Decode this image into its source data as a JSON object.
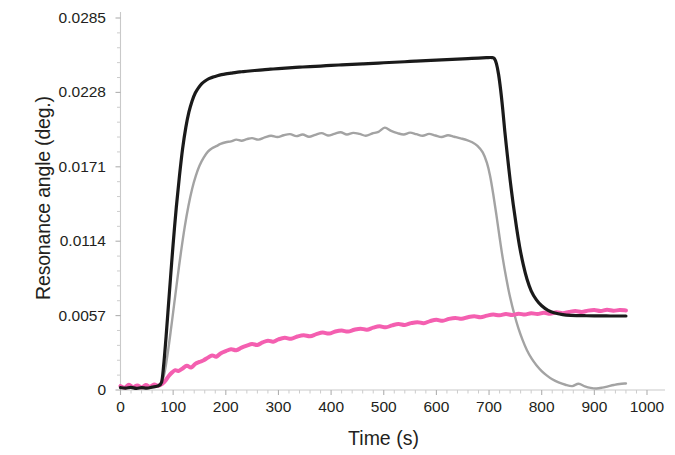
{
  "chart_data": {
    "type": "line",
    "title": "",
    "xlabel": "Time (s)",
    "ylabel": "Resonance angle (deg.)",
    "xlim": [
      0,
      1000
    ],
    "ylim": [
      0,
      0.0285
    ],
    "xticks": [
      0,
      100,
      200,
      300,
      400,
      500,
      600,
      700,
      800,
      900,
      1000
    ],
    "xtick_labels": [
      "0",
      "100",
      "200",
      "300",
      "400",
      "500",
      "600",
      "700",
      "800",
      "900",
      "1000"
    ],
    "yticks": [
      0,
      0.0057,
      0.0114,
      0.0171,
      0.0228,
      0.0285
    ],
    "ytick_labels": [
      "0",
      "0.0057",
      "0.0114",
      "0.0171",
      "0.0228",
      "0.0285"
    ],
    "grid": false,
    "legend": "none",
    "minor_ticks": true,
    "series": [
      {
        "name": "black-curve",
        "color": "#1a1a1a",
        "line_width": 3.2,
        "x": [
          0,
          10,
          20,
          30,
          40,
          50,
          60,
          70,
          78,
          82,
          86,
          90,
          95,
          100,
          106,
          112,
          118,
          124,
          130,
          136,
          142,
          148,
          154,
          160,
          168,
          176,
          184,
          192,
          200,
          210,
          220,
          230,
          240,
          255,
          270,
          285,
          300,
          320,
          340,
          360,
          380,
          400,
          420,
          440,
          460,
          480,
          500,
          520,
          540,
          560,
          580,
          600,
          620,
          640,
          660,
          680,
          695,
          705,
          710,
          714,
          718,
          722,
          726,
          730,
          735,
          740,
          746,
          752,
          758,
          765,
          772,
          780,
          790,
          800,
          812,
          825,
          840,
          855,
          870,
          885,
          900,
          915,
          930,
          945,
          960
        ],
        "y": [
          0.00018,
          0.00015,
          0.0002,
          0.00012,
          0.00018,
          0.00015,
          0.00022,
          0.0003,
          0.0006,
          0.0019,
          0.0038,
          0.0059,
          0.0086,
          0.0112,
          0.014,
          0.0164,
          0.0185,
          0.0201,
          0.0213,
          0.02215,
          0.02275,
          0.02315,
          0.02345,
          0.02365,
          0.02385,
          0.02398,
          0.02408,
          0.02416,
          0.02422,
          0.02428,
          0.02434,
          0.02438,
          0.02442,
          0.02448,
          0.02453,
          0.02458,
          0.02462,
          0.02468,
          0.02473,
          0.02478,
          0.02482,
          0.02487,
          0.02491,
          0.02495,
          0.02499,
          0.02503,
          0.02507,
          0.02511,
          0.02515,
          0.02519,
          0.02523,
          0.02527,
          0.02531,
          0.02535,
          0.02539,
          0.02543,
          0.02546,
          0.02547,
          0.0254,
          0.025,
          0.0242,
          0.023,
          0.0215,
          0.0198,
          0.0179,
          0.0161,
          0.0142,
          0.0125,
          0.011,
          0.0096,
          0.0085,
          0.0076,
          0.0069,
          0.00645,
          0.0061,
          0.0059,
          0.00578,
          0.00572,
          0.0057,
          0.00569,
          0.00568,
          0.00568,
          0.00567,
          0.00567,
          0.00567
        ]
      },
      {
        "name": "grey-curve",
        "color": "#a3a3a3",
        "line_width": 2.4,
        "x": [
          0,
          10,
          20,
          30,
          40,
          50,
          60,
          70,
          78,
          84,
          90,
          96,
          102,
          108,
          115,
          122,
          129,
          136,
          143,
          150,
          158,
          166,
          174,
          182,
          190,
          200,
          210,
          220,
          230,
          240,
          250,
          262,
          274,
          286,
          298,
          310,
          322,
          334,
          346,
          358,
          370,
          382,
          394,
          406,
          418,
          430,
          442,
          454,
          466,
          478,
          490,
          502,
          514,
          526,
          538,
          550,
          562,
          574,
          586,
          598,
          610,
          622,
          634,
          646,
          658,
          668,
          678,
          688,
          696,
          702,
          708,
          714,
          720,
          726,
          733,
          740,
          748,
          756,
          764,
          772,
          781,
          790,
          800,
          810,
          820,
          832,
          845,
          858,
          870,
          882,
          893,
          904,
          915,
          926,
          937,
          948,
          960
        ],
        "y": [
          0.00022,
          0.00016,
          0.00024,
          0.00014,
          0.0002,
          0.00018,
          0.00026,
          0.00034,
          0.00055,
          0.0014,
          0.0029,
          0.0047,
          0.0066,
          0.0085,
          0.0106,
          0.0125,
          0.0141,
          0.0154,
          0.0164,
          0.01718,
          0.0178,
          0.01826,
          0.01852,
          0.01868,
          0.01885,
          0.01898,
          0.01905,
          0.01918,
          0.0191,
          0.01922,
          0.0193,
          0.01918,
          0.01935,
          0.01948,
          0.01938,
          0.01952,
          0.0196,
          0.01945,
          0.01958,
          0.0194,
          0.01955,
          0.01968,
          0.0195,
          0.01962,
          0.01975,
          0.01958,
          0.0197,
          0.01962,
          0.01948,
          0.01965,
          0.01978,
          0.0201,
          0.01985,
          0.01968,
          0.01958,
          0.01972,
          0.0196,
          0.01948,
          0.01962,
          0.0195,
          0.01938,
          0.01952,
          0.0194,
          0.01928,
          0.01915,
          0.01898,
          0.0187,
          0.0182,
          0.0174,
          0.0164,
          0.015,
          0.0134,
          0.0117,
          0.0101,
          0.0085,
          0.0071,
          0.0058,
          0.0047,
          0.0038,
          0.00305,
          0.0024,
          0.0019,
          0.00145,
          0.0011,
          0.00082,
          0.00058,
          0.0004,
          0.0003,
          0.00048,
          0.00028,
          0.00016,
          0.00012,
          0.00018,
          0.00028,
          0.00038,
          0.00046,
          0.0005
        ]
      },
      {
        "name": "pink-curve",
        "color": "#f45fb0",
        "line_width": 4.0,
        "x": [
          0,
          8,
          16,
          24,
          32,
          40,
          48,
          56,
          64,
          72,
          80,
          86,
          92,
          98,
          104,
          110,
          118,
          126,
          134,
          142,
          150,
          158,
          166,
          174,
          182,
          190,
          200,
          210,
          220,
          230,
          240,
          250,
          260,
          270,
          280,
          290,
          300,
          312,
          324,
          336,
          348,
          360,
          372,
          384,
          396,
          408,
          420,
          432,
          444,
          456,
          468,
          480,
          492,
          504,
          516,
          528,
          540,
          552,
          564,
          576,
          588,
          600,
          612,
          624,
          636,
          648,
          660,
          672,
          684,
          696,
          708,
          720,
          732,
          744,
          756,
          768,
          780,
          792,
          804,
          816,
          828,
          840,
          852,
          864,
          876,
          888,
          900,
          912,
          924,
          936,
          948,
          960
        ],
        "y": [
          0.0003,
          0.00018,
          0.0004,
          0.00022,
          0.00035,
          0.0002,
          0.00038,
          0.00024,
          0.00042,
          0.00032,
          0.0005,
          0.00075,
          0.0011,
          0.00135,
          0.00152,
          0.00145,
          0.00165,
          0.00185,
          0.00172,
          0.002,
          0.00215,
          0.00228,
          0.00248,
          0.00265,
          0.00255,
          0.0028,
          0.00298,
          0.00312,
          0.00305,
          0.00325,
          0.0034,
          0.00352,
          0.00345,
          0.00365,
          0.00378,
          0.0037,
          0.00388,
          0.004,
          0.00392,
          0.0041,
          0.0042,
          0.00412,
          0.00428,
          0.0044,
          0.00432,
          0.00448,
          0.00455,
          0.00448,
          0.00462,
          0.0047,
          0.00462,
          0.00478,
          0.00488,
          0.0048,
          0.00495,
          0.00505,
          0.00498,
          0.00512,
          0.0052,
          0.00512,
          0.00528,
          0.00538,
          0.0053,
          0.00545,
          0.00552,
          0.00545,
          0.00558,
          0.00565,
          0.00558,
          0.0057,
          0.00578,
          0.00572,
          0.00582,
          0.00575,
          0.00585,
          0.00578,
          0.00588,
          0.00582,
          0.00592,
          0.00585,
          0.00595,
          0.00588,
          0.00598,
          0.00605,
          0.00598,
          0.00608,
          0.00612,
          0.00605,
          0.00615,
          0.00608,
          0.00612,
          0.0061
        ]
      }
    ]
  }
}
